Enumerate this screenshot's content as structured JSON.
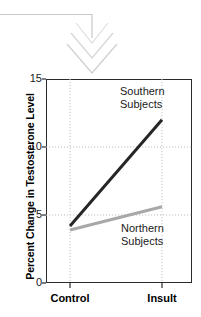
{
  "decoration": {
    "name": "downward-chevron-arrow",
    "color": "#d8d8d8",
    "connector_color": "#c9c9c9"
  },
  "chart_data": {
    "type": "line",
    "title": "",
    "subtitle": "",
    "xlabel": "",
    "ylabel": "Percent Change in Testosterone Level",
    "categories": [
      "Control",
      "Insult"
    ],
    "x_tick_labels": [
      "Control",
      "Insult"
    ],
    "y_tick_labels": [
      "0",
      "5",
      "10",
      "15"
    ],
    "y_ticks": [
      0,
      5,
      10,
      15
    ],
    "ylim": [
      0,
      15
    ],
    "grid": true,
    "grid_style": "dotted",
    "grid_color": "#bfbfbf",
    "legend_position": "inline-annotation",
    "series": [
      {
        "name": "Southern Subjects",
        "label_lines": [
          "Southern",
          "Subjects"
        ],
        "values": [
          4.2,
          12.0
        ],
        "color": "#262626",
        "line_width": 3
      },
      {
        "name": "Northern Subjects",
        "label_lines": [
          "Northern",
          "Subjects"
        ],
        "values": [
          3.9,
          5.6
        ],
        "color": "#a8a8a8",
        "line_width": 3
      }
    ],
    "axis_color": "#2b2b2b"
  }
}
